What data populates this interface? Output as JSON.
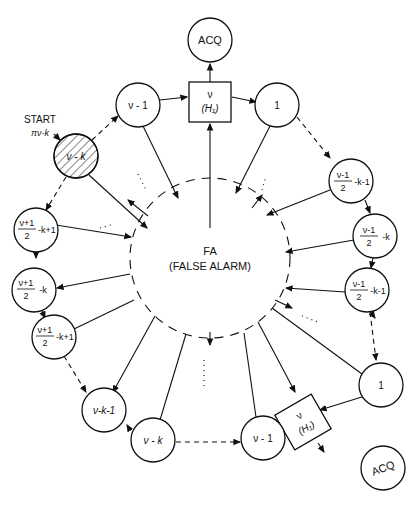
{
  "diagram": {
    "type": "state-transition",
    "center": {
      "title": "FA",
      "subtitle": "(FALSE ALARM)"
    },
    "start_label": "START",
    "start_prob": "πν-k",
    "nodes": {
      "acq_top": "ACQ",
      "box_top_num": "ν",
      "box_top_sub": "(H₁)",
      "top_left": "ν - 1",
      "top_right": "1",
      "start": "ν - k",
      "r1_num": "ν-1",
      "r1_den": "2",
      "r1_tail": "-k-1",
      "r2_num": "ν-1",
      "r2_den": "2",
      "r2_tail": "-k",
      "r3_num": "ν-1",
      "r3_den": "2",
      "r3_tail": "-k-1",
      "bottom_right_one": "1",
      "box_bottom_num": "ν",
      "box_bottom_sub": "(H₁)",
      "acq_bottom": "ACQ",
      "bottom_nu1": "ν - 1",
      "bottom_nuk": "ν - k",
      "bottom_nuk1": "ν-k-1",
      "l1_num": "ν+1",
      "l1_den": "2",
      "l1_tail": "-k+1",
      "l2_num": "ν+1",
      "l2_den": "2",
      "l2_tail": "-k",
      "l3_num": "ν+1",
      "l3_den": "2",
      "l3_tail": "-k+1"
    },
    "ellipsis": "⋮"
  }
}
